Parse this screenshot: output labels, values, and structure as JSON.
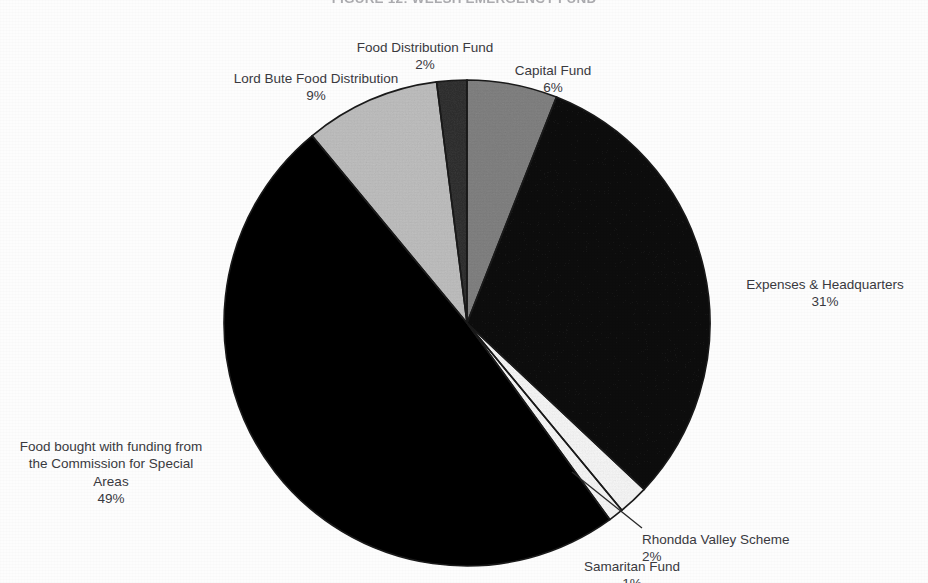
{
  "chart_data": {
    "type": "pie",
    "title": "FIGURE 12: WELSH EMERGENCY FUND",
    "xlabel": "",
    "ylabel": "",
    "legend": "none (direct labels)",
    "grid": false,
    "total_percent": 100,
    "categories": [
      "Capital Fund",
      "Expenses & Headquarters",
      "Rhondda Valley Scheme",
      "Samaritan Fund",
      "Food bought with funding from the Commission for Special Areas",
      "Lord Bute Food Distribution",
      "Food Distribution Fund"
    ],
    "values": [
      6,
      31,
      2,
      1,
      49,
      9,
      2
    ],
    "slices": [
      {
        "label": "Capital Fund",
        "value": 6,
        "value_text": "6%",
        "color": "#b4b4b4"
      },
      {
        "label": "Expenses & Headquarters",
        "value": 31,
        "value_text": "31%",
        "color": "#3c3c3c"
      },
      {
        "label": "Rhondda Valley Scheme",
        "value": 2,
        "value_text": "2%",
        "color": "#fbfbfb"
      },
      {
        "label": "Samaritan Fund",
        "value": 1,
        "value_text": "1%",
        "color": "#fbfbfb"
      },
      {
        "label": "Food bought with funding from the Commission for Special Areas",
        "value": 49,
        "value_text": "49%",
        "color": "#151515"
      },
      {
        "label": "Lord Bute Food Distribution",
        "value": 9,
        "value_text": "9%",
        "color": "#dcdcdc"
      },
      {
        "label": "Food Distribution Fund",
        "value": 2,
        "value_text": "2%",
        "color": "#6e6e6e"
      }
    ]
  },
  "labels": {
    "food_distribution_fund": {
      "name": "Food Distribution Fund",
      "pct": "2%"
    },
    "lord_bute": {
      "name": "Lord Bute Food Distribution",
      "pct": "9%"
    },
    "capital_fund": {
      "name": "Capital Fund",
      "pct": "6%"
    },
    "expenses_hq": {
      "name": "Expenses & Headquarters",
      "pct": "31%"
    },
    "commission_special_areas": {
      "name": "Food bought with funding from\nthe Commission for Special\nAreas",
      "pct": "49%"
    },
    "rhondda": {
      "name": "Rhondda Valley Scheme",
      "pct": "2%"
    },
    "samaritan": {
      "name": "Samaritan Fund",
      "pct": "1%"
    }
  },
  "colors": {
    "page_background": "#fdfdfd",
    "text": "#3a3a3f",
    "slice_outline": "#1a1a1a",
    "leader_line": "#2a2a2a"
  }
}
